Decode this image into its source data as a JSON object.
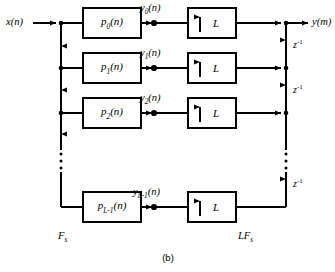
{
  "figure": {
    "caption": "(b)",
    "input_label": "x(n)",
    "output_label": "y(m)",
    "input_rate_label": {
      "base": "F",
      "sub": "s"
    },
    "output_rate_label": {
      "base": "LF",
      "sub": "s"
    },
    "delay_label": {
      "base": "z",
      "sup": "-1"
    },
    "upsampler_factor": "L",
    "upsampler_arrow": "up-arrow",
    "ellipsis_glyph": "vertical-ellipsis",
    "line_color": "#000000",
    "background_color": "#ffffff"
  },
  "branches": [
    {
      "index": 0,
      "filter_label": {
        "base": "p",
        "sub": "0",
        "arg": "(n)"
      },
      "signal_label": {
        "base": "y",
        "sub": "0",
        "arg": "(n)"
      },
      "upsampler_label": "L",
      "has_delay_below": true
    },
    {
      "index": 1,
      "filter_label": {
        "base": "p",
        "sub": "1",
        "arg": "(n)"
      },
      "signal_label": {
        "base": "y",
        "sub": "1",
        "arg": "(n)"
      },
      "upsampler_label": "L",
      "has_delay_below": true
    },
    {
      "index": 2,
      "filter_label": {
        "base": "p",
        "sub": "2",
        "arg": "(n)"
      },
      "signal_label": {
        "base": "y",
        "sub": "2",
        "arg": "(n)"
      },
      "upsampler_label": "L",
      "has_delay_below": true
    },
    {
      "index": 3,
      "filter_label": {
        "base": "p",
        "sub": "L-1",
        "arg": "(n)"
      },
      "signal_label": {
        "base": "y",
        "sub": "L-1",
        "arg": "(n)"
      },
      "upsampler_label": "L",
      "has_delay_below": false
    }
  ],
  "delays": [
    {
      "index": 0,
      "base": "z",
      "sup": "-1"
    },
    {
      "index": 1,
      "base": "z",
      "sup": "-1"
    },
    {
      "index": 2,
      "base": "z",
      "sup": "-1"
    }
  ]
}
